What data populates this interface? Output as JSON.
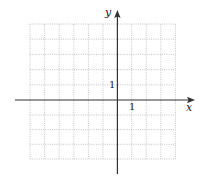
{
  "figure": {
    "type": "coordinate-grid",
    "x_axis_label": "x",
    "y_axis_label": "y",
    "x_unit_label": "1",
    "y_unit_label": "1",
    "grid": {
      "columns": 10,
      "rows": 9,
      "columns_left_of_y_axis": 6,
      "columns_right_of_y_axis": 4,
      "rows_above_x_axis": 5,
      "rows_below_x_axis": 4,
      "line_style": "dotted"
    },
    "colors": {
      "axis": "#333333",
      "grid": "#b0b0b0"
    }
  }
}
